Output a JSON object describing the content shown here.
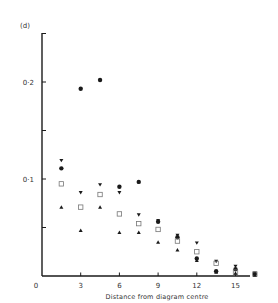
{
  "chart_data": {
    "type": "scatter",
    "title": "",
    "panel_label": "(d)",
    "xlabel": "Distance from diagram centre",
    "ylabel": "",
    "xlim": [
      0,
      16.5
    ],
    "ylim": [
      0,
      0.25
    ],
    "x_ticks": [
      0,
      3,
      6,
      9,
      12,
      15
    ],
    "x_tick_labels": [
      "0",
      "3",
      "6",
      "9",
      "12",
      "15"
    ],
    "y_ticks": [
      0.05,
      0.1,
      0.15,
      0.2,
      0.25
    ],
    "y_tick_labels": [
      {
        "value": 0.1,
        "label": "0·1"
      },
      {
        "value": 0.2,
        "label": "0·2"
      }
    ],
    "grid": false,
    "legend": null,
    "series": [
      {
        "name": "filled circles",
        "marker": "circle-filled",
        "x": [
          1.5,
          3,
          4.5,
          6,
          7.5,
          9,
          10.5,
          12,
          13.5,
          15,
          16.5
        ],
        "y": [
          0.111,
          0.193,
          0.202,
          0.092,
          0.097,
          0.056,
          0.04,
          0.018,
          0.005,
          0.007,
          0.002
        ]
      },
      {
        "name": "inverted triangles",
        "marker": "triangle-down-filled",
        "x": [
          1.5,
          3,
          4.5,
          6,
          7.5,
          9,
          10.5,
          12,
          13.5,
          15,
          16.5
        ],
        "y": [
          0.119,
          0.086,
          0.094,
          0.086,
          0.063,
          0.057,
          0.042,
          0.034,
          0.015,
          0.01,
          0.003
        ]
      },
      {
        "name": "open squares",
        "marker": "square-open",
        "x": [
          1.5,
          3,
          4.5,
          6,
          7.5,
          9,
          10.5,
          12,
          13.5,
          15,
          16.5
        ],
        "y": [
          0.095,
          0.071,
          0.084,
          0.064,
          0.054,
          0.048,
          0.036,
          0.025,
          0.013,
          0.004,
          0.002
        ]
      },
      {
        "name": "upright triangles",
        "marker": "triangle-up-filled",
        "x": [
          1.5,
          3,
          4.5,
          6,
          7.5,
          9,
          10.5,
          12,
          13.5,
          15,
          16.5
        ],
        "y": [
          0.071,
          0.047,
          0.071,
          0.045,
          0.045,
          0.035,
          0.027,
          0.016,
          0.004,
          0.003,
          0.001
        ]
      }
    ]
  },
  "layout": {
    "origin_px": [
      42,
      276
    ],
    "px_per_x": 12.9,
    "px_per_y": 970,
    "y_axis_top_px": 33,
    "x_axis_right_px": 250,
    "ink": "#1a1a1a",
    "square_color": "#777777"
  }
}
